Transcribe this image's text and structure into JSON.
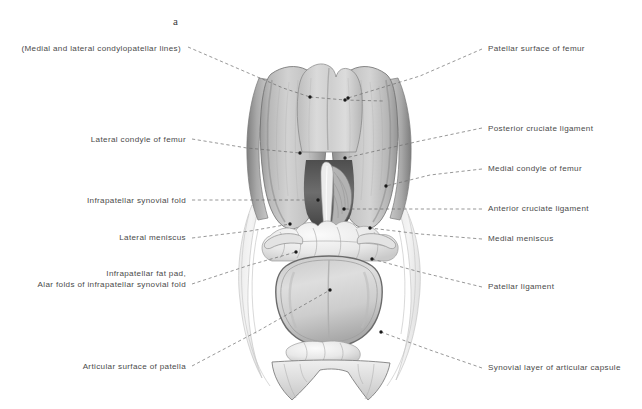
{
  "figure": {
    "panel_letter": "a",
    "background_color": "#ffffff",
    "text_color": "#4a4a4a",
    "leader_line_color": "#6b6b6b",
    "marker_color": "#1a1a1a"
  },
  "labels_left": [
    {
      "id": "condylopatellar-lines",
      "lines": [
        "(Medial and lateral condylopatellar lines)"
      ],
      "text_right_x": 181,
      "text_baseline_y": 51,
      "leader": [
        [
          188,
          47
        ],
        [
          283,
          88
        ],
        [
          310,
          97
        ]
      ],
      "branch": [
        [
          310,
          97
        ],
        [
          345,
          100
        ],
        [
          383,
          101
        ]
      ],
      "markers": [
        [
          310,
          97
        ],
        [
          345,
          100
        ]
      ]
    },
    {
      "id": "lateral-condyle-of-femur",
      "lines": [
        "Lateral condyle of femur"
      ],
      "text_right_x": 186,
      "text_baseline_y": 142,
      "leader": [
        [
          192,
          139
        ],
        [
          247,
          148
        ],
        [
          300,
          153
        ]
      ],
      "branch": [],
      "markers": [
        [
          300,
          153
        ]
      ]
    },
    {
      "id": "infrapatellar-synovial-fold",
      "lines": [
        "Infrapatellar synovial fold"
      ],
      "text_right_x": 186,
      "text_baseline_y": 203,
      "leader": [
        [
          192,
          200
        ],
        [
          260,
          200
        ],
        [
          318,
          200
        ]
      ],
      "branch": [],
      "markers": [
        [
          318,
          200
        ]
      ]
    },
    {
      "id": "lateral-meniscus",
      "lines": [
        "Lateral meniscus"
      ],
      "text_right_x": 186,
      "text_baseline_y": 240,
      "leader": [
        [
          192,
          238
        ],
        [
          250,
          231
        ],
        [
          290,
          224
        ]
      ],
      "branch": [],
      "markers": [
        [
          290,
          224
        ]
      ]
    },
    {
      "id": "infrapatellar-fat-pad",
      "lines": [
        "Infrapatellar fat pad,",
        "Alar folds of infrapatellar synovial fold"
      ],
      "text_right_x": 186,
      "text_baseline_y": 287,
      "leader": [
        [
          192,
          284
        ],
        [
          250,
          265
        ],
        [
          296,
          252
        ]
      ],
      "branch": [],
      "markers": [
        [
          296,
          252
        ]
      ]
    },
    {
      "id": "articular-surface-of-patella",
      "lines": [
        "Articular surface of patella"
      ],
      "text_right_x": 186,
      "text_baseline_y": 369,
      "leader": [
        [
          192,
          366
        ],
        [
          260,
          330
        ],
        [
          330,
          290
        ]
      ],
      "branch": [],
      "markers": [
        [
          330,
          290
        ]
      ]
    }
  ],
  "labels_right": [
    {
      "id": "patellar-surface-of-femur",
      "lines": [
        "Patellar surface of femur"
      ],
      "text_left_x": 488,
      "text_baseline_y": 51,
      "leader": [
        [
          482,
          49
        ],
        [
          420,
          76
        ],
        [
          348,
          98
        ]
      ],
      "branch": [],
      "markers": [
        [
          348,
          98
        ]
      ]
    },
    {
      "id": "posterior-cruciate-ligament",
      "lines": [
        "Posterior cruciate ligament"
      ],
      "text_left_x": 488,
      "text_baseline_y": 131,
      "leader": [
        [
          482,
          128
        ],
        [
          420,
          141
        ],
        [
          345,
          158
        ]
      ],
      "branch": [],
      "markers": [
        [
          345,
          158
        ]
      ]
    },
    {
      "id": "medial-condyle-of-femur",
      "lines": [
        "Medial condyle of femur"
      ],
      "text_left_x": 488,
      "text_baseline_y": 171,
      "leader": [
        [
          482,
          169
        ],
        [
          430,
          175
        ],
        [
          386,
          186
        ]
      ],
      "branch": [],
      "markers": [
        [
          386,
          186
        ]
      ]
    },
    {
      "id": "anterior-cruciate-ligament",
      "lines": [
        "Anterior cruciate ligament"
      ],
      "text_left_x": 488,
      "text_baseline_y": 211,
      "leader": [
        [
          482,
          209
        ],
        [
          420,
          209
        ],
        [
          344,
          209
        ]
      ],
      "branch": [],
      "markers": [
        [
          344,
          209
        ]
      ]
    },
    {
      "id": "medial-meniscus",
      "lines": [
        "Medial meniscus"
      ],
      "text_left_x": 488,
      "text_baseline_y": 241,
      "leader": [
        [
          482,
          239
        ],
        [
          420,
          234
        ],
        [
          370,
          228
        ]
      ],
      "branch": [],
      "markers": [
        [
          370,
          228
        ]
      ]
    },
    {
      "id": "patellar-ligament",
      "lines": [
        "Patellar ligament"
      ],
      "text_left_x": 488,
      "text_baseline_y": 289,
      "leader": [
        [
          482,
          287
        ],
        [
          420,
          272
        ],
        [
          372,
          259
        ]
      ],
      "branch": [],
      "markers": [
        [
          372,
          259
        ]
      ]
    },
    {
      "id": "synovial-layer-of-articular-capsule",
      "lines": [
        "Synovial layer of articular capsule"
      ],
      "text_left_x": 488,
      "text_baseline_y": 370,
      "leader": [
        [
          482,
          368
        ],
        [
          430,
          350
        ],
        [
          381,
          332
        ]
      ],
      "branch": [],
      "markers": [
        [
          381,
          332
        ]
      ]
    }
  ],
  "illustration_regions": [
    {
      "name": "lateral-femoral-condyle",
      "description": "Large rounded articular eminence, left of midline"
    },
    {
      "name": "medial-femoral-condyle",
      "description": "Large rounded articular eminence, right of midline"
    },
    {
      "name": "patellar-surface",
      "description": "Concave trochlear groove between condyles, superior"
    },
    {
      "name": "intercondylar-fossa",
      "description": "Deep notch between condyles housing cruciate ligaments"
    },
    {
      "name": "anterior-cruciate-ligament",
      "description": "Pale vertical band descending in intercondylar fossa"
    },
    {
      "name": "posterior-cruciate-ligament",
      "description": "Striated band posterior to ACL"
    },
    {
      "name": "lateral-meniscus",
      "description": "Lobulated fibrocartilage crescent, left tibial plateau"
    },
    {
      "name": "medial-meniscus",
      "description": "Lobulated fibrocartilage crescent, right tibial plateau"
    },
    {
      "name": "infrapatellar-fat-pad",
      "description": "Irregular adipose lobules anterior to menisci"
    },
    {
      "name": "patella-articular-surface",
      "description": "Reflected patella with bicondylar facets, inferior center"
    },
    {
      "name": "patellar-ligament",
      "description": "Broad fibrous band inferior to patella"
    },
    {
      "name": "synovial-capsule",
      "description": "Translucent membrane wings flaring laterally and inferiorly"
    }
  ]
}
